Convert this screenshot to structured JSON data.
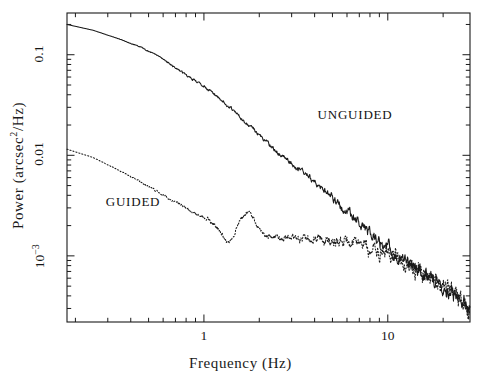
{
  "figure": {
    "background_color": "#ffffff",
    "line_color": "#1a1a1a",
    "frame": {
      "left": 67,
      "top": 13,
      "right": 470,
      "bottom": 322
    }
  },
  "axes": {
    "x": {
      "label": "Frequency (Hz)",
      "scale": "log",
      "range": [
        0.18,
        28
      ],
      "major_ticks": [
        {
          "value": 1,
          "label": "1"
        },
        {
          "value": 10,
          "label": "10"
        }
      ],
      "minor_ticks": [
        0.2,
        0.3,
        0.4,
        0.5,
        0.6,
        0.7,
        0.8,
        0.9,
        2,
        3,
        4,
        5,
        6,
        7,
        8,
        9,
        20
      ],
      "tick_direction": "in",
      "mirrored_top_axis": true
    },
    "y": {
      "label": "Power (arcsec²/Hz)",
      "label_parts": {
        "prefix": "Power (arcsec",
        "exponent": "2",
        "suffix": "/Hz)"
      },
      "scale": "log",
      "range": [
        0.00022,
        0.26
      ],
      "major_ticks": [
        {
          "value": 0.1,
          "label": "0.1"
        },
        {
          "value": 0.01,
          "label": "0.01"
        },
        {
          "value": 0.001,
          "label": "10",
          "exponent": "−3"
        }
      ],
      "minor_ticks": [
        0.2,
        0.09,
        0.08,
        0.07,
        0.06,
        0.05,
        0.04,
        0.03,
        0.02,
        0.009,
        0.008,
        0.007,
        0.006,
        0.005,
        0.004,
        0.003,
        0.002,
        0.0009,
        0.0008,
        0.0007,
        0.0006,
        0.0005,
        0.0004,
        0.0003
      ],
      "tick_direction": "in",
      "mirrored_right_axis": true
    }
  },
  "annotations": [
    {
      "name": "unguided-label",
      "text": "UNGUIDED",
      "x_px": 355,
      "y_px": 116
    },
    {
      "name": "guided-label",
      "text": "GUIDED",
      "x_px": 133,
      "y_px": 203
    }
  ],
  "chart_data": {
    "type": "line",
    "title": "",
    "xlabel": "Frequency (Hz)",
    "ylabel": "Power (arcsec^2/Hz)",
    "xscale": "log",
    "yscale": "log",
    "xlim": [
      0.18,
      28
    ],
    "ylim": [
      0.00022,
      0.26
    ],
    "grid": false,
    "legend": "inline annotations",
    "series": [
      {
        "name": "UNGUIDED",
        "style": "solid",
        "anchors_x": [
          0.18,
          0.25,
          0.34,
          0.45,
          0.58,
          0.72,
          0.9,
          1.15,
          1.45,
          1.8,
          2.2,
          2.7,
          3.3,
          4.0,
          5.0,
          6.2,
          7.5,
          9.0,
          11.0,
          14.0,
          17.0,
          21.0,
          25.0,
          28.0
        ],
        "anchors_y": [
          0.2,
          0.175,
          0.145,
          0.12,
          0.095,
          0.072,
          0.055,
          0.04,
          0.028,
          0.019,
          0.0132,
          0.0098,
          0.0072,
          0.0054,
          0.0038,
          0.0027,
          0.0019,
          0.0014,
          0.00105,
          0.00078,
          0.00062,
          0.00048,
          0.00036,
          0.0003
        ],
        "noise_onset_hz": 1.0,
        "noise_amplitude_dex": 0.085
      },
      {
        "name": "GUIDED",
        "style": "dotted",
        "anchors_x": [
          0.18,
          0.25,
          0.34,
          0.45,
          0.58,
          0.72,
          0.9,
          1.15,
          1.45,
          1.8,
          2.2,
          2.7,
          3.3,
          4.0,
          5.0,
          6.2,
          7.5,
          9.0,
          11.0,
          14.0,
          17.0,
          21.0,
          25.0,
          28.0
        ],
        "anchors_y": [
          0.0115,
          0.0095,
          0.0072,
          0.0055,
          0.0042,
          0.0033,
          0.0026,
          0.0021,
          0.00175,
          0.0019,
          0.00155,
          0.0015,
          0.00148,
          0.0015,
          0.00145,
          0.00135,
          0.00125,
          0.00115,
          0.00098,
          0.00076,
          0.00061,
          0.00047,
          0.00036,
          0.0003
        ],
        "noise_onset_hz": 0.85,
        "noise_amplitude_dex": 0.105
      }
    ]
  }
}
